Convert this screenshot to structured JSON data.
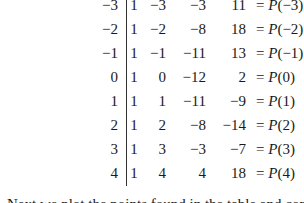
{
  "table": {
    "divisor_column_label": "",
    "rows": [
      {
        "x": "−3",
        "one": "1",
        "b": "−3",
        "c": "−3",
        "d": "11",
        "p_prefix": "= ",
        "p_func": "P",
        "p_arg": "(−3)"
      },
      {
        "x": "−2",
        "one": "1",
        "b": "−2",
        "c": "−8",
        "d": "18",
        "p_prefix": "= ",
        "p_func": "P",
        "p_arg": "(−2)"
      },
      {
        "x": "−1",
        "one": "1",
        "b": "−1",
        "c": "−11",
        "d": "13",
        "p_prefix": "= ",
        "p_func": "P",
        "p_arg": "(−1)"
      },
      {
        "x": "0",
        "one": "1",
        "b": "0",
        "c": "−12",
        "d": "2",
        "p_prefix": "= ",
        "p_func": "P",
        "p_arg": "(0)"
      },
      {
        "x": "1",
        "one": "1",
        "b": "1",
        "c": "−11",
        "d": "−9",
        "p_prefix": "= ",
        "p_func": "P",
        "p_arg": "(1)"
      },
      {
        "x": "2",
        "one": "1",
        "b": "2",
        "c": "−8",
        "d": "−14",
        "p_prefix": "= ",
        "p_func": "P",
        "p_arg": "(2)"
      },
      {
        "x": "3",
        "one": "1",
        "b": "3",
        "c": "−3",
        "d": "−7",
        "p_prefix": "= ",
        "p_func": "P",
        "p_arg": "(3)"
      },
      {
        "x": "4",
        "one": "1",
        "b": "4",
        "c": "4",
        "d": "18",
        "p_prefix": "= ",
        "p_func": "P",
        "p_arg": "(4)"
      }
    ]
  },
  "paragraph": {
    "text": "Next we plot the points found in the table and connect the"
  }
}
